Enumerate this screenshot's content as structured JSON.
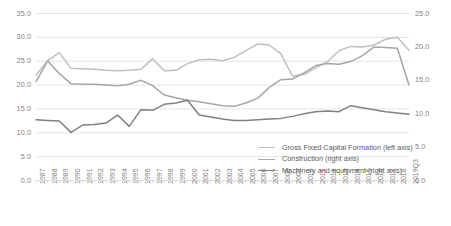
{
  "chart_data": {
    "type": "line",
    "title": "",
    "xlabel": "",
    "ylabel": "",
    "grid": true,
    "legend_position": "inside-right-lower",
    "categories": [
      "1987",
      "1988",
      "1989",
      "1990",
      "1991",
      "1992",
      "1993",
      "1994",
      "1995",
      "1996",
      "1997",
      "1998",
      "1999",
      "2000",
      "2001",
      "2002",
      "2003",
      "2004",
      "2005",
      "2006",
      "2007",
      "2008",
      "2009",
      "2010",
      "2011",
      "2012",
      "2013",
      "2014",
      "2015",
      "2016",
      "2017",
      "2018",
      "2019Q3"
    ],
    "left_axis": {
      "label": "",
      "min": 0.0,
      "max": 35.0,
      "step": 5.0,
      "ticks": [
        "0.0",
        "5.0",
        "10.0",
        "15.0",
        "20.0",
        "25.0",
        "30.0",
        "35.0"
      ]
    },
    "right_axis": {
      "label": "",
      "min": 0.0,
      "max": 25.0,
      "step": 5.0,
      "ticks": [
        "0.0",
        "5.0",
        "10.0",
        "15.0",
        "20.0",
        "25.0"
      ]
    },
    "series": [
      {
        "name": "Gross Fixed Capital Formation (left axis)",
        "axis": "left",
        "color": "#bfbfbf",
        "values": [
          22.1,
          25.1,
          26.8,
          23.5,
          23.4,
          23.3,
          23.1,
          23.0,
          23.1,
          23.3,
          25.5,
          23.0,
          23.1,
          24.5,
          25.3,
          25.4,
          25.1,
          25.8,
          27.2,
          28.6,
          28.4,
          26.6,
          21.9,
          22.2,
          23.6,
          24.9,
          27.2,
          28.1,
          28.0,
          28.4,
          29.6,
          30.0,
          27.3
        ]
      },
      {
        "name": "Construction (right axis)",
        "axis": "right",
        "color": "#a6a6a6",
        "values": [
          14.8,
          17.9,
          16.0,
          14.5,
          14.4,
          14.4,
          14.3,
          14.2,
          14.4,
          15.0,
          14.2,
          12.8,
          12.4,
          12.0,
          11.8,
          11.5,
          11.2,
          11.1,
          11.6,
          12.3,
          13.9,
          15.1,
          15.2,
          16.1,
          17.2,
          17.5,
          17.4,
          17.8,
          18.7,
          20.0,
          19.9,
          19.8,
          14.3
        ]
      },
      {
        "name": "Machinery and equipment (right axis)",
        "axis": "right",
        "color": "#808080",
        "values": [
          9.1,
          9.0,
          8.9,
          7.2,
          8.3,
          8.4,
          8.6,
          9.8,
          8.1,
          10.6,
          10.5,
          11.4,
          11.6,
          12.0,
          9.8,
          9.5,
          9.2,
          9.0,
          9.0,
          9.1,
          9.2,
          9.3,
          9.6,
          10.0,
          10.3,
          10.4,
          10.3,
          11.2,
          10.9,
          10.6,
          10.3,
          10.1,
          9.9
        ]
      }
    ]
  },
  "legend": {
    "items": [
      {
        "label": "Gross Fixed Capital Formation (left axis)",
        "color": "#bfbfbf"
      },
      {
        "label": "Construction (right axis)",
        "color": "#a6a6a6"
      },
      {
        "label": "Machinery and equipment (right axis)",
        "color": "#808080"
      }
    ]
  }
}
